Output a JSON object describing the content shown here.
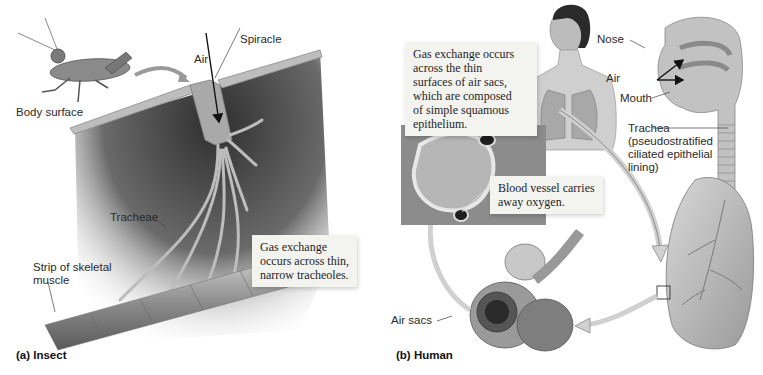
{
  "figure": {
    "panels": [
      {
        "id": "insect",
        "caption": "(a) Insect",
        "labels": {
          "spiracle": "Spiracle",
          "air": "Air",
          "body_surface": "Body surface",
          "tracheae": "Tracheae",
          "muscle_line1": "Strip of skeletal",
          "muscle_line2": "muscle"
        },
        "callout": {
          "lines": [
            "Gas exchange",
            "occurs across thin,",
            "narrow tracheoles."
          ]
        }
      },
      {
        "id": "human",
        "caption": "(b) Human",
        "labels": {
          "nose": "Nose",
          "air": "Air",
          "mouth": "Mouth",
          "trachea_line1": "Trachea",
          "trachea_line2": "(pseudostratified",
          "trachea_line3": "ciliated epithelial",
          "trachea_line4": "lining)",
          "air_sacs": "Air sacs"
        },
        "callout_air_sacs": {
          "lines": [
            "Gas exchange occurs",
            "across the thin",
            "surfaces of air sacs,",
            "which are composed",
            "of simple squamous",
            "epithelium."
          ]
        },
        "callout_blood_vessel": {
          "lines": [
            "Blood vessel carries",
            "away oxygen."
          ]
        }
      }
    ],
    "colors": {
      "tissue": "#b9b9b9",
      "dark_interior": "#3c3c3c",
      "callout_bg": "#f3f3f0",
      "arrow": "#111111"
    }
  }
}
